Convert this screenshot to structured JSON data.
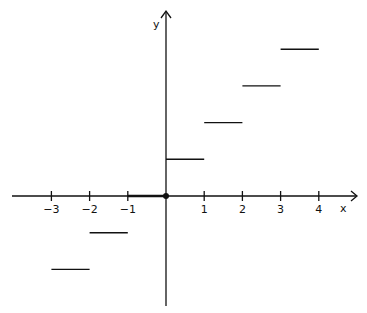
{
  "chart_data": {
    "type": "line",
    "title": "",
    "xlabel": "x",
    "ylabel": "y",
    "x_ticks": [
      -3,
      -2,
      -1,
      1,
      2,
      3,
      4
    ],
    "x_tick_labels": [
      "−3",
      "−2",
      "−1",
      "1",
      "2",
      "3",
      "4"
    ],
    "xlim": [
      -4,
      4.5
    ],
    "ylim": [
      -3,
      4.5
    ],
    "grid": false,
    "legend": null,
    "segments": [
      {
        "x_start": -3,
        "x_end": -2,
        "y": -2
      },
      {
        "x_start": -2,
        "x_end": -1,
        "y": -1
      },
      {
        "x_start": -1,
        "x_end": 0,
        "y": 0
      },
      {
        "x_start": 0,
        "x_end": 1,
        "y": 1
      },
      {
        "x_start": 1,
        "x_end": 2,
        "y": 2
      },
      {
        "x_start": 2,
        "x_end": 3,
        "y": 3
      },
      {
        "x_start": 3,
        "x_end": 4,
        "y": 4
      }
    ],
    "annotations": [
      {
        "type": "filled-point",
        "x": 0,
        "y": 0
      }
    ]
  }
}
